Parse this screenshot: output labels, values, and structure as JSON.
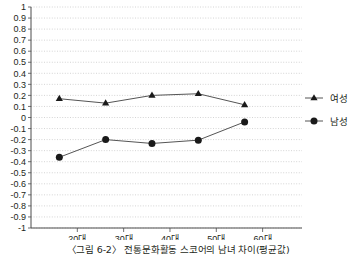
{
  "chart_data": {
    "type": "line",
    "title": "",
    "xlabel": "",
    "ylabel": "",
    "categories": [
      "20대",
      "30대",
      "40대",
      "50대",
      "60대"
    ],
    "ylim": [
      -1,
      1
    ],
    "ytick_step": 0.1,
    "yticks": [
      "1",
      "0.9",
      "0.8",
      "0.7",
      "0.6",
      "0.5",
      "0.4",
      "0.3",
      "0.2",
      "0.1",
      "0",
      "-0.1",
      "-0.2",
      "-0.3",
      "-0.4",
      "-0.5",
      "-0.6",
      "-0.7",
      "-0.8",
      "-0.9",
      "-1"
    ],
    "grid": true,
    "grid_style": "dotted-horizontal",
    "legend_position": "right",
    "series": [
      {
        "name": "여성",
        "marker": "triangle",
        "color": "#1a1a1a",
        "values": [
          0.17,
          0.13,
          0.2,
          0.215,
          0.115
        ]
      },
      {
        "name": "남성",
        "marker": "circle",
        "color": "#1a1a1a",
        "values": [
          -0.36,
          -0.2,
          -0.235,
          -0.205,
          -0.04
        ]
      }
    ]
  },
  "caption": {
    "text": "〈그림 6-2〉 전통문화활동 스코어의 남녀 차이(평균값)"
  },
  "legend": {
    "items": [
      {
        "label": "여성",
        "marker": "triangle-marker-icon"
      },
      {
        "label": "남성",
        "marker": "circle-marker-icon"
      }
    ]
  },
  "colors": {
    "line": "#555555",
    "marker": "#1a1a1a",
    "grid": "#c9c9c9",
    "axis": "#4d4d4d",
    "text": "#231f20"
  }
}
